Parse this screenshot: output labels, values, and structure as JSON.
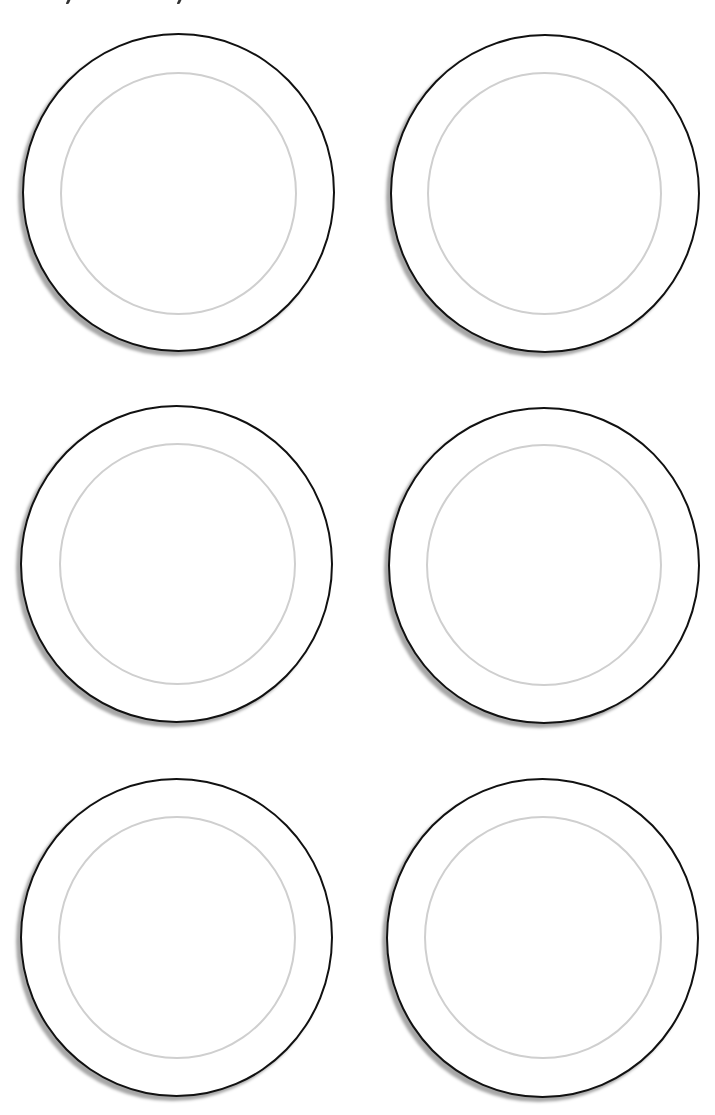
{
  "page": {
    "type": "printable worksheet",
    "background": "#ffffff",
    "header_text_visible": false,
    "header_fragments": [
      {
        "x": 67
      },
      {
        "x": 178
      }
    ]
  },
  "plates": [
    {
      "id": 1,
      "row": 1,
      "col": 1,
      "outer": {
        "x": 22,
        "y": 33,
        "w": 313,
        "h": 319
      },
      "inner": {
        "x": 60,
        "y": 72,
        "w": 237,
        "h": 243
      }
    },
    {
      "id": 2,
      "row": 1,
      "col": 2,
      "outer": {
        "x": 390,
        "y": 34,
        "w": 310,
        "h": 319
      },
      "inner": {
        "x": 427,
        "y": 72,
        "w": 235,
        "h": 243
      }
    },
    {
      "id": 3,
      "row": 2,
      "col": 1,
      "outer": {
        "x": 20,
        "y": 405,
        "w": 313,
        "h": 318
      },
      "inner": {
        "x": 59,
        "y": 443,
        "w": 237,
        "h": 242
      }
    },
    {
      "id": 4,
      "row": 2,
      "col": 2,
      "outer": {
        "x": 388,
        "y": 407,
        "w": 312,
        "h": 317
      },
      "inner": {
        "x": 426,
        "y": 444,
        "w": 236,
        "h": 242
      }
    },
    {
      "id": 5,
      "row": 3,
      "col": 1,
      "outer": {
        "x": 20,
        "y": 778,
        "w": 313,
        "h": 319
      },
      "inner": {
        "x": 58,
        "y": 816,
        "w": 238,
        "h": 243
      }
    },
    {
      "id": 6,
      "row": 3,
      "col": 2,
      "outer": {
        "x": 386,
        "y": 778,
        "w": 313,
        "h": 320
      },
      "inner": {
        "x": 424,
        "y": 816,
        "w": 238,
        "h": 243
      }
    }
  ],
  "colors": {
    "outer_stroke": "#111111",
    "inner_stroke": "#cfcfcf",
    "shadow": "#777777"
  }
}
